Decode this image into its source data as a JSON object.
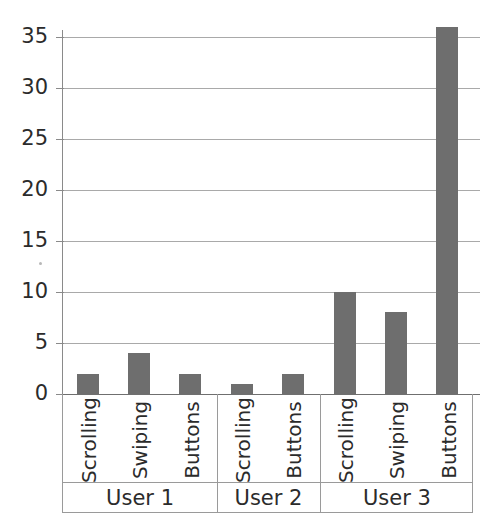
{
  "chart_data": {
    "type": "bar",
    "title": "",
    "subtitle": "",
    "xlabel": "",
    "ylabel": "",
    "ylim": [
      0,
      37
    ],
    "yticks": [
      0,
      5,
      10,
      15,
      20,
      25,
      30,
      35
    ],
    "ytick_labels": [
      "0",
      "5",
      "10",
      "15",
      "20",
      "25",
      "30",
      "35"
    ],
    "grid": true,
    "legend": false,
    "legend_position": "none",
    "orientation": "vertical",
    "bar_color": "#6e6e6e",
    "background_color": "#ffffff",
    "axis_color": "#8a8a8a",
    "gridline_color": "#a9a9a9",
    "categories": [
      "Scrolling",
      "Swiping",
      "Buttons",
      "Scrolling",
      "Buttons",
      "Scrolling",
      "Swiping",
      "Buttons"
    ],
    "values": [
      2,
      4,
      2,
      1,
      2,
      10,
      8,
      36
    ],
    "groups": [
      {
        "label": "User 1",
        "categories": [
          "Scrolling",
          "Swiping",
          "Buttons"
        ],
        "values": [
          2,
          4,
          2
        ]
      },
      {
        "label": "User 2",
        "categories": [
          "Scrolling",
          "Buttons"
        ],
        "values": [
          1,
          2
        ]
      },
      {
        "label": "User 3",
        "categories": [
          "Scrolling",
          "Swiping",
          "Buttons"
        ],
        "values": [
          10,
          8,
          36
        ]
      }
    ]
  },
  "axis": {
    "ticks": [
      {
        "label": "35",
        "value": 35
      },
      {
        "label": "30",
        "value": 30
      },
      {
        "label": "25",
        "value": 25
      },
      {
        "label": "20",
        "value": 20
      },
      {
        "label": "15",
        "value": 15
      },
      {
        "label": "10",
        "value": 10
      },
      {
        "label": "5",
        "value": 5
      },
      {
        "label": "0",
        "value": 0
      }
    ]
  },
  "bars": [
    {
      "category": "Scrolling",
      "group": "User 1",
      "value": 2
    },
    {
      "category": "Swiping",
      "group": "User 1",
      "value": 4
    },
    {
      "category": "Buttons",
      "group": "User 1",
      "value": 2
    },
    {
      "category": "Scrolling",
      "group": "User 2",
      "value": 1
    },
    {
      "category": "Buttons",
      "group": "User 2",
      "value": 2
    },
    {
      "category": "Scrolling",
      "group": "User 3",
      "value": 10
    },
    {
      "category": "Swiping",
      "group": "User 3",
      "value": 8
    },
    {
      "category": "Buttons",
      "group": "User 3",
      "value": 36
    }
  ],
  "group_labels": [
    "User 1",
    "User 2",
    "User 3"
  ]
}
